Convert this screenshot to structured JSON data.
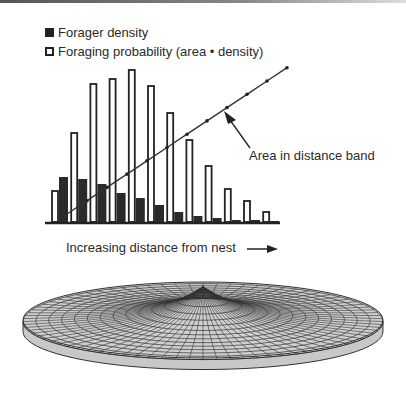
{
  "chart_data": {
    "type": "bar",
    "title": "",
    "xlabel": "Increasing distance from nest",
    "ylabel": "",
    "categories": [
      "1",
      "2",
      "3",
      "4",
      "5",
      "6",
      "7",
      "8",
      "9",
      "10",
      "11",
      "12"
    ],
    "series": [
      {
        "name": "Forager density",
        "style": "filled",
        "color": "#222222",
        "values": [
          45,
          43,
          38,
          29,
          24,
          17,
          10,
          6,
          4,
          2,
          2,
          1
        ]
      },
      {
        "name": "Foraging probability (area × density)",
        "style": "open",
        "color": "#222222",
        "values": [
          31,
          89,
          138,
          143,
          152,
          136,
          109,
          82,
          56,
          33,
          21,
          10
        ]
      },
      {
        "name": "Area in distance band",
        "type": "line",
        "color": "#333333",
        "values": [
          8,
          22,
          36,
          50,
          64,
          78,
          92,
          106,
          120,
          134,
          148,
          162
        ]
      }
    ],
    "legend": {
      "position": "top-left",
      "entries": [
        "Forager density",
        "Foraging probability (area × density)"
      ]
    },
    "annotations": [
      "Area in distance band"
    ],
    "grid": false,
    "axes_ticks": false
  },
  "legend": {
    "item1": "Forager density",
    "item2": "Foraging probability (area • density)"
  },
  "annotation": "Area in distance band",
  "xlabel": "Increasing distance from nest",
  "surface_caption": ""
}
